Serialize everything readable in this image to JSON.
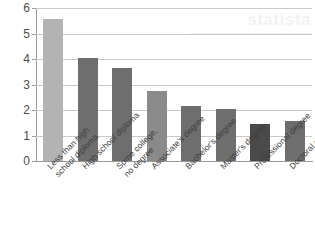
{
  "watermark": {
    "text": "statista"
  },
  "chart_data": {
    "type": "bar",
    "title": "",
    "subtitle": "",
    "xlabel": "",
    "ylabel": "",
    "ylim": [
      0,
      6
    ],
    "yticks": [
      0,
      1,
      2,
      3,
      4,
      5,
      6
    ],
    "ytick_labels": [
      "0",
      "1",
      "2",
      "3",
      "4",
      "5",
      "6"
    ],
    "grid": true,
    "legend": "none",
    "categories": [
      "Less than high school diploma",
      "High school diploma",
      "Some college, no degree",
      "Associate's degree",
      "Bachelor's degree",
      "Master's degree",
      "Professional degree",
      "Doctoral degree"
    ],
    "category_lines": [
      [
        "Less than high",
        "school diploma"
      ],
      [
        "High school diploma",
        ""
      ],
      [
        "Some college,",
        "no degree"
      ],
      [
        "Associate's degree",
        ""
      ],
      [
        "Bachelor's degree",
        ""
      ],
      [
        "Master's degree",
        ""
      ],
      [
        "Professional degree",
        ""
      ],
      [
        "Doctoral degree",
        ""
      ]
    ],
    "values": [
      5.55,
      4.05,
      3.65,
      2.75,
      2.15,
      2.05,
      1.45,
      1.55
    ],
    "bar_colors": [
      "#b3b3b3",
      "#6e6e6e",
      "#6e6e6e",
      "#8a8a8a",
      "#6e6e6e",
      "#6e6e6e",
      "#4a4a4a",
      "#6e6e6e"
    ]
  },
  "footer": {
    "ghost_text": ""
  }
}
